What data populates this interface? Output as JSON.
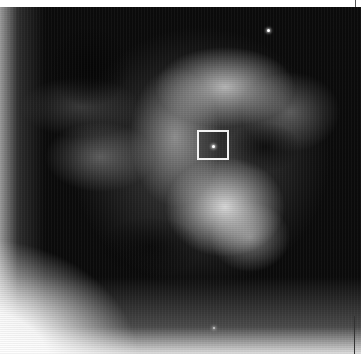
{
  "image": {
    "description": "Grayscale astronomical image of a filamentary nebula with a central star",
    "colors": {
      "background": "#0b0b0b",
      "highlight": "#f2f2f2",
      "marker": "#f2f2f2",
      "border_top": "#ffffff"
    },
    "marker": {
      "shape": "square",
      "label": "",
      "x": 197,
      "y": 130,
      "width": 32,
      "height": 30
    },
    "stars": [
      {
        "name": "central-star",
        "x": 213,
        "y": 146
      },
      {
        "name": "upper-right-star",
        "x": 268,
        "y": 30
      },
      {
        "name": "bottom-star",
        "x": 214,
        "y": 327
      }
    ]
  }
}
